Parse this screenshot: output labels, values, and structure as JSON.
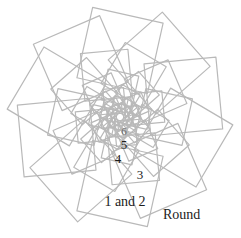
{
  "figure": {
    "name": "rosette-spiral-squares",
    "background_color": "#ffffff",
    "line_color": "#b9b9b9",
    "line_width": 1.2,
    "center": {
      "x": 120,
      "y": 117
    },
    "bounds": {
      "left": 10,
      "top": 13,
      "right": 232,
      "bottom": 222
    }
  },
  "geometry": {
    "type": "spiral-of-squares-rosette",
    "petals": 10,
    "rings": 6,
    "rotation_step_deg": 36,
    "scale_step": 0.66,
    "outer_half_diagonal": 111,
    "start_angle_deg": -90,
    "description": "Ten squares arranged in a ring, each successive ring rotated and scaled inward forming a star rosette"
  },
  "labels": {
    "rings": [
      {
        "id": "ring-6",
        "text": "6",
        "x": 124,
        "y": 131,
        "faint": true
      },
      {
        "id": "ring-5",
        "text": "5",
        "x": 124,
        "y": 144,
        "faint": false
      },
      {
        "id": "ring-4",
        "text": "4",
        "x": 118,
        "y": 158,
        "faint": false
      },
      {
        "id": "ring-3",
        "text": "3",
        "x": 140,
        "y": 174,
        "faint": false
      }
    ],
    "pair": {
      "id": "ring-1-and-2",
      "text": "1 and 2",
      "x": 125,
      "y": 202
    },
    "caption": {
      "id": "round-caption",
      "text": "Round",
      "x": 163,
      "y": 215
    }
  }
}
